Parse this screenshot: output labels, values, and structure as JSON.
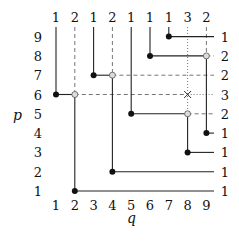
{
  "axes": {
    "x_label": "q",
    "y_label": "p",
    "x_ticks": [
      "1",
      "2",
      "3",
      "4",
      "5",
      "6",
      "7",
      "8",
      "9"
    ],
    "y_ticks": [
      "9",
      "8",
      "7",
      "6",
      "5",
      "4",
      "3",
      "2",
      "1"
    ]
  },
  "top_labels": [
    "1",
    "2",
    "1",
    "2",
    "1",
    "1",
    "1",
    "3",
    "2"
  ],
  "right_labels": [
    "1",
    "2",
    "2",
    "3",
    "2",
    "1",
    "1",
    "1",
    "1"
  ],
  "filled_points": [
    [
      1,
      6
    ],
    [
      3,
      7
    ],
    [
      5,
      5
    ],
    [
      6,
      8
    ],
    [
      7,
      9
    ],
    [
      2,
      1
    ],
    [
      4,
      2
    ],
    [
      8,
      3
    ],
    [
      9,
      4
    ]
  ],
  "hollow_points": [
    [
      2,
      6
    ],
    [
      4,
      7
    ],
    [
      8,
      5
    ],
    [
      9,
      8
    ]
  ],
  "cross_points": [
    [
      8,
      6
    ]
  ],
  "solid_segments": [
    [
      [
        1,
        10
      ],
      [
        1,
        6
      ]
    ],
    [
      [
        1,
        6
      ],
      [
        2,
        6
      ]
    ],
    [
      [
        2,
        6
      ],
      [
        2,
        1
      ]
    ],
    [
      [
        2,
        1
      ],
      [
        10,
        1
      ]
    ],
    [
      [
        3,
        10
      ],
      [
        3,
        7
      ]
    ],
    [
      [
        3,
        7
      ],
      [
        4,
        7
      ]
    ],
    [
      [
        4,
        7
      ],
      [
        4,
        2
      ]
    ],
    [
      [
        4,
        2
      ],
      [
        10,
        2
      ]
    ],
    [
      [
        5,
        10
      ],
      [
        5,
        5
      ]
    ],
    [
      [
        5,
        5
      ],
      [
        8,
        5
      ]
    ],
    [
      [
        8,
        5
      ],
      [
        8,
        3
      ]
    ],
    [
      [
        8,
        3
      ],
      [
        10,
        3
      ]
    ],
    [
      [
        6,
        10
      ],
      [
        6,
        8
      ]
    ],
    [
      [
        6,
        8
      ],
      [
        9,
        8
      ]
    ],
    [
      [
        9,
        8
      ],
      [
        9,
        4
      ]
    ],
    [
      [
        9,
        4
      ],
      [
        10,
        4
      ]
    ],
    [
      [
        7,
        10
      ],
      [
        7,
        9
      ]
    ],
    [
      [
        7,
        9
      ],
      [
        10,
        9
      ]
    ]
  ],
  "dashed_segments": [
    [
      [
        2,
        10
      ],
      [
        2,
        6
      ]
    ],
    [
      [
        2,
        6
      ],
      [
        8,
        6
      ]
    ],
    [
      [
        4,
        10
      ],
      [
        4,
        7
      ]
    ],
    [
      [
        4,
        7
      ],
      [
        10,
        7
      ]
    ],
    [
      [
        9,
        10
      ],
      [
        9,
        8
      ]
    ],
    [
      [
        9,
        8
      ],
      [
        10,
        8
      ]
    ],
    [
      [
        8,
        5
      ],
      [
        10,
        5
      ]
    ]
  ],
  "dotted_segments": [
    [
      [
        8,
        10
      ],
      [
        8,
        5
      ]
    ],
    [
      [
        8,
        6
      ],
      [
        10,
        6
      ]
    ]
  ]
}
